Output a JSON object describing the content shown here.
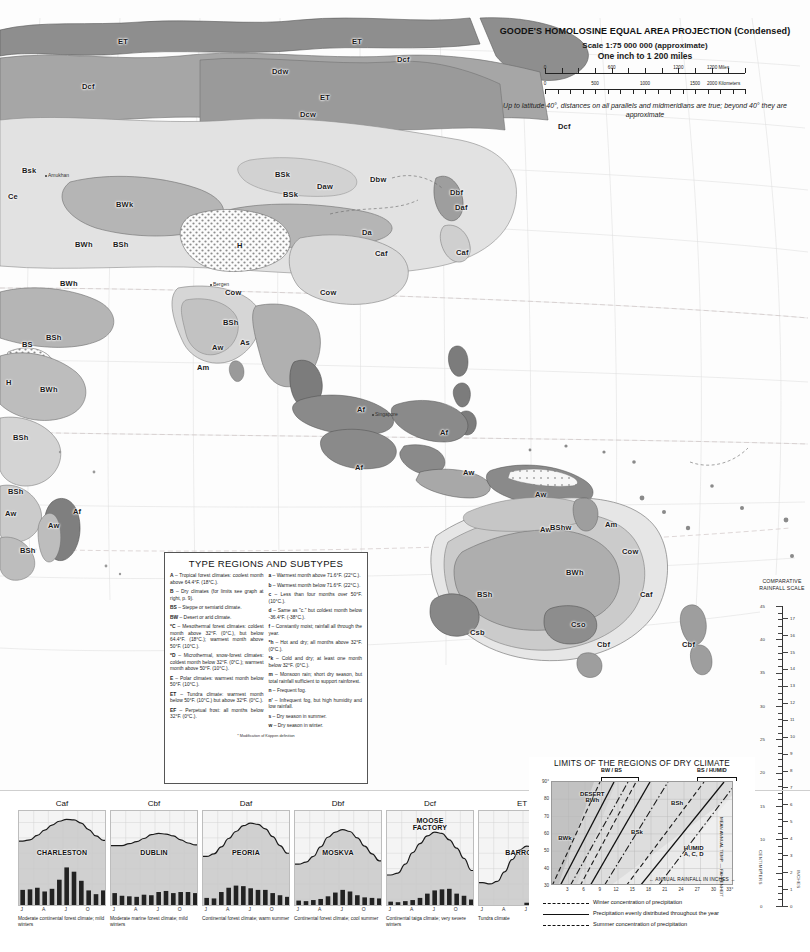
{
  "projection": {
    "title": "GOODE'S HOMOLOSINE EQUAL AREA PROJECTION (Condensed)",
    "scale": "Scale 1:75 000 000 (approximate)",
    "inch": "One inch to 1 200 miles",
    "miles_ticks": [
      "0",
      "600",
      "1200",
      "1200 Miles"
    ],
    "km_ticks": [
      "0",
      "500",
      "1000",
      "1500",
      "2000 Kilometers"
    ],
    "note": "Up to latitude 40°, distances on all parallels and midmeridians are true; beyond 40° they are approximate"
  },
  "legend": {
    "title": "TYPE REGIONS AND SUBTYPES",
    "footnote": "* Modification of Köppen definition",
    "left": [
      "A – Tropical forest climates: coolest month above 64.4°F. (18°C.).",
      "B – Dry climates (for limits see graph at right, p. 9).",
      "BS – Steppe or semiarid climate.",
      "BW – Desert or arid climate.",
      "*C – Mesothermal forest climates: coldest month above 32°F. (0°C.), but below 64.4°F. (18°C.); warmest month above 50°F. (10°C.).",
      "*D – Microthermal, snow-forest climates: coldest month below 32°F. (0°C.); warmest month above 50°F. (10°C.).",
      "E – Polar climates: warmest month below 50°F. (10°C.).",
      "ET – Tundra climate: warmest month below 50°F. (10°C.) but above 32°F. (0°C.).",
      "EF – Perpetual frost: all months below 32°F. (0°C.)."
    ],
    "right": [
      "a – Warmest month above 71.6°F. (22°C.).",
      "b – Warmest month below 71.6°F. (22°C.).",
      "c – Less than four months over 50°F. (10°C.).",
      "d – Same as \"c.\" but coldest month below -36.4°F. (-38°C.).",
      "f – Constantly moist; rainfall all through the year.",
      "*h – Hot and dry; all months above 32°F. (0°C.).",
      "*k – Cold and dry; at least one month below 32°F. (0°C.).",
      "m – Monsoon rain; short dry season, but total rainfall sufficient to support rainforest.",
      "n – Frequent fog.",
      "n' – Infrequent fog, but high humidity and low rainfall.",
      "s – Dry season in summer.",
      "w – Dry season in winter."
    ]
  },
  "rainfall_scale": {
    "title": "COMPARATIVE RAINFALL SCALE",
    "cm_unit": "CENTIMETERS",
    "in_unit": "INCHES",
    "cm_labels": [
      "45",
      "40",
      "35",
      "30",
      "25",
      "20",
      "15",
      "10",
      "5",
      "0"
    ],
    "in_labels": [
      "17",
      "16",
      "15",
      "14",
      "13",
      "12",
      "11",
      "10",
      "9",
      "8",
      "7",
      "6",
      "5",
      "4",
      "3",
      "2",
      "1",
      "0"
    ]
  },
  "curve_note": {
    "line1": "CURVES SHOW FAHRENHEIT TEMPERATURE",
    "line2": "VERTICAL BARS SHOW RAINFALL IN INCHES"
  },
  "climographs": {
    "y_ticks": [
      "90°",
      "80",
      "50",
      "32",
      "14",
      "4",
      "-22",
      "-40"
    ],
    "rain_ticks": [
      "14\"",
      "12",
      "10",
      "8",
      "6",
      "4",
      "2",
      "0"
    ],
    "months": [
      "J",
      "A",
      "J",
      "O"
    ],
    "items": [
      {
        "code": "Caf",
        "city": "CHARLESTON",
        "caption": "Moderate continental forest climate; mild winters",
        "temps": [
          48,
          50,
          57,
          65,
          73,
          79,
          82,
          81,
          76,
          66,
          56,
          49
        ],
        "precip": [
          3.2,
          3.3,
          3.6,
          2.9,
          3.4,
          5.1,
          7.4,
          6.6,
          4.9,
          3.1,
          2.4,
          3.1
        ]
      },
      {
        "code": "Cbf",
        "city": "DUBLIN",
        "caption": "Moderate marine forest climate; mild winters",
        "temps": [
          41,
          41,
          44,
          47,
          52,
          58,
          60,
          59,
          56,
          50,
          45,
          42
        ],
        "precip": [
          2.6,
          2.1,
          2.0,
          1.9,
          2.3,
          2.2,
          2.8,
          3.0,
          2.6,
          2.8,
          2.8,
          2.6
        ]
      },
      {
        "code": "Daf",
        "city": "PEORIA",
        "caption": "Continental forest climate; warm summer",
        "temps": [
          24,
          28,
          39,
          52,
          63,
          72,
          76,
          74,
          67,
          55,
          41,
          29
        ],
        "precip": [
          1.7,
          1.6,
          2.8,
          3.6,
          4.0,
          3.9,
          3.5,
          3.2,
          3.2,
          2.6,
          2.2,
          1.9
        ]
      },
      {
        "code": "Dbf",
        "city": "MOSKVA",
        "caption": "Continental forest climate; cool summer",
        "temps": [
          12,
          15,
          24,
          39,
          54,
          62,
          66,
          63,
          53,
          40,
          28,
          17
        ],
        "precip": [
          1.2,
          1.1,
          1.3,
          1.5,
          2.0,
          2.7,
          3.2,
          2.9,
          2.2,
          1.8,
          1.7,
          1.6
        ]
      },
      {
        "code": "Dcf",
        "city": "MOOSE FACTORY",
        "caption": "Continental taiga climate; very severe winters",
        "temps": [
          -5,
          -2,
          12,
          30,
          44,
          56,
          62,
          60,
          50,
          37,
          21,
          2
        ],
        "precip": [
          1.0,
          0.9,
          1.1,
          1.3,
          1.7,
          2.5,
          3.1,
          3.3,
          3.4,
          2.5,
          2.1,
          1.4
        ]
      },
      {
        "code": "ET",
        "city": "BARROW",
        "caption": "Tundra climate",
        "temps": [
          -17,
          -19,
          -15,
          0,
          19,
          34,
          40,
          39,
          31,
          16,
          0,
          -12
        ],
        "precip": [
          0.2,
          0.2,
          0.2,
          0.2,
          0.2,
          0.3,
          0.8,
          0.9,
          0.6,
          0.5,
          0.3,
          0.2
        ]
      },
      {
        "code": "EF",
        "city": "EISMITTE",
        "caption": "Glacial climate (Data incomplete)",
        "temps": [
          -44,
          -53,
          -43,
          -22,
          -12,
          -2,
          10,
          5,
          -13,
          -26,
          -37,
          -42
        ],
        "precip": [
          0,
          0,
          0,
          0,
          0,
          0,
          0,
          0,
          0,
          0,
          0,
          0
        ]
      }
    ]
  },
  "dry_graph": {
    "title": "LIMITS OF THE REGIONS OF DRY CLIMATE",
    "y_label": "MEAN ANNUAL TEMP. — FAHRENHEIT",
    "x_label": "ANNUAL RAINFALL IN INCHES",
    "y_ticks": [
      "90°",
      "80",
      "70",
      "60",
      "50",
      "40",
      "30"
    ],
    "x_ticks": [
      "3",
      "6",
      "9",
      "12",
      "15",
      "18",
      "21",
      "24",
      "27",
      "30",
      "33°"
    ],
    "regions": [
      {
        "name": "DESERT\nBWh",
        "x": 16,
        "y": 10
      },
      {
        "name": "BWk",
        "x": 4,
        "y": 52
      },
      {
        "name": "BSh",
        "x": 66,
        "y": 18
      },
      {
        "name": "BSk",
        "x": 44,
        "y": 46
      },
      {
        "name": "HUMID\nA, C, D",
        "x": 73,
        "y": 62
      }
    ],
    "brackets": [
      "BW / BS",
      "BS / HUMID"
    ],
    "key": [
      "Winter concentration of precipitation",
      "Precipitation evenly distributed throughout the year",
      "Summer concentration of precipitation"
    ]
  },
  "map": {
    "labels": [
      {
        "t": "ET",
        "x": 118,
        "y": 37
      },
      {
        "t": "ET",
        "x": 352,
        "y": 37
      },
      {
        "t": "ET",
        "x": 320,
        "y": 93
      },
      {
        "t": "Dcf",
        "x": 82,
        "y": 82
      },
      {
        "t": "Ddw",
        "x": 272,
        "y": 67
      },
      {
        "t": "Dcf",
        "x": 397,
        "y": 55
      },
      {
        "t": "Dcw",
        "x": 300,
        "y": 110
      },
      {
        "t": "Dcf",
        "x": 558,
        "y": 122
      },
      {
        "t": "Bsk",
        "x": 22,
        "y": 166
      },
      {
        "t": "BSk",
        "x": 275,
        "y": 170
      },
      {
        "t": "BSk",
        "x": 283,
        "y": 190
      },
      {
        "t": "Daw",
        "x": 317,
        "y": 182
      },
      {
        "t": "Dbw",
        "x": 370,
        "y": 175
      },
      {
        "t": "Dbf",
        "x": 450,
        "y": 188
      },
      {
        "t": "Ce",
        "x": 8,
        "y": 192
      },
      {
        "t": "BWk",
        "x": 116,
        "y": 200
      },
      {
        "t": "Daf",
        "x": 455,
        "y": 203
      },
      {
        "t": "Da",
        "x": 362,
        "y": 228
      },
      {
        "t": "Caf",
        "x": 375,
        "y": 249
      },
      {
        "t": "Caf",
        "x": 456,
        "y": 248
      },
      {
        "t": "BWh",
        "x": 75,
        "y": 240
      },
      {
        "t": "BSh",
        "x": 113,
        "y": 240
      },
      {
        "t": "H",
        "x": 237,
        "y": 241
      },
      {
        "t": "BWh",
        "x": 60,
        "y": 279
      },
      {
        "t": "Cow",
        "x": 225,
        "y": 288
      },
      {
        "t": "Cow",
        "x": 320,
        "y": 288
      },
      {
        "t": "BS",
        "x": 22,
        "y": 340
      },
      {
        "t": "BWh",
        "x": 40,
        "y": 385
      },
      {
        "t": "H",
        "x": 6,
        "y": 378
      },
      {
        "t": "BSh",
        "x": 46,
        "y": 333
      },
      {
        "t": "Aw",
        "x": 212,
        "y": 343
      },
      {
        "t": "Am",
        "x": 197,
        "y": 363
      },
      {
        "t": "As",
        "x": 240,
        "y": 338
      },
      {
        "t": "BSh",
        "x": 223,
        "y": 318
      },
      {
        "t": "BSh",
        "x": 13,
        "y": 433
      },
      {
        "t": "BSh",
        "x": 8,
        "y": 487
      },
      {
        "t": "Aw",
        "x": 5,
        "y": 509
      },
      {
        "t": "Af",
        "x": 73,
        "y": 507
      },
      {
        "t": "Aw",
        "x": 48,
        "y": 521
      },
      {
        "t": "BSh",
        "x": 20,
        "y": 546
      },
      {
        "t": "Af",
        "x": 357,
        "y": 405
      },
      {
        "t": "Af",
        "x": 440,
        "y": 428
      },
      {
        "t": "Af",
        "x": 355,
        "y": 463
      },
      {
        "t": "Aw",
        "x": 463,
        "y": 468
      },
      {
        "t": "Aw",
        "x": 535,
        "y": 490
      },
      {
        "t": "Aw",
        "x": 540,
        "y": 525
      },
      {
        "t": "BShw",
        "x": 550,
        "y": 523
      },
      {
        "t": "Am",
        "x": 605,
        "y": 520
      },
      {
        "t": "BWh",
        "x": 566,
        "y": 568
      },
      {
        "t": "Cow",
        "x": 622,
        "y": 547
      },
      {
        "t": "BSh",
        "x": 477,
        "y": 590
      },
      {
        "t": "Caf",
        "x": 640,
        "y": 590
      },
      {
        "t": "Csb",
        "x": 470,
        "y": 628
      },
      {
        "t": "Cso",
        "x": 571,
        "y": 620
      },
      {
        "t": "Cbf",
        "x": 597,
        "y": 640
      },
      {
        "t": "Cbf",
        "x": 682,
        "y": 640
      }
    ],
    "cities": [
      {
        "t": "Amukhan",
        "x": 48,
        "y": 172
      },
      {
        "t": "Bergen",
        "x": 213,
        "y": 281
      },
      {
        "t": "Singapore",
        "x": 375,
        "y": 411
      }
    ],
    "tropics": [
      "Tropic of Cancer",
      "Tropic of Capricorn",
      "Equator"
    ]
  }
}
